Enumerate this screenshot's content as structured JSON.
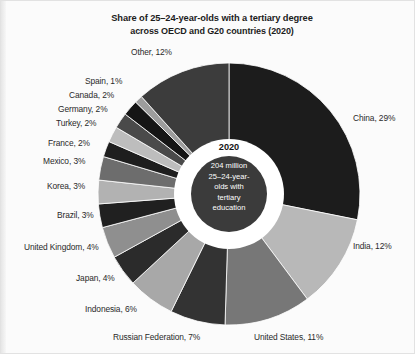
{
  "page": {
    "background_color": "#fbfbfb",
    "text_color": "#2a2a2a"
  },
  "title": {
    "line1": "Share of 25–24-year-olds with a tertiary degree",
    "line2": "across OECD and G20 countries (2020)"
  },
  "center": {
    "year": "2020",
    "annotation": "204 million 25–24-year-olds with tertiary education",
    "annotation_lines": [
      "204 million",
      "25–24-year-",
      "olds with",
      "tertiary",
      "education"
    ],
    "ring_color": "#ffffff",
    "inner_color": "#3b3b3b",
    "inner_text_color": "#ffffff"
  },
  "chart_data": {
    "type": "pie",
    "variant": "donut",
    "title": "Share of 25–24-year-olds with a tertiary degree across OECD and G20 countries (2020)",
    "legend": "none",
    "grid": false,
    "total_label": "204 million 25–24-year-olds with tertiary education",
    "units": "percent",
    "start_angle_deg": 0,
    "direction": "clockwise",
    "categories": [
      "China",
      "India",
      "United States",
      "Russian Federation",
      "Indonesia",
      "Japan",
      "United Kingdom",
      "Brazil",
      "Korea",
      "Mexico",
      "France",
      "Turkey",
      "Germany",
      "Canada",
      "Spain",
      "Other"
    ],
    "values": [
      29,
      12,
      11,
      7,
      6,
      4,
      4,
      3,
      3,
      3,
      2,
      2,
      2,
      2,
      1,
      12
    ],
    "slices": [
      {
        "label": "China, 29%",
        "name": "China",
        "value": 29,
        "color": "#1c1c1c",
        "label_x": 352,
        "label_y": 112,
        "align": "left"
      },
      {
        "label": "India, 12%",
        "name": "India",
        "value": 12,
        "color": "#b8b8b8",
        "label_x": 352,
        "label_y": 240,
        "align": "left"
      },
      {
        "label": "United States, 11%",
        "name": "United States",
        "value": 11,
        "color": "#777777",
        "label_x": 253,
        "label_y": 331,
        "align": "left"
      },
      {
        "label": "Russian Federation, 7%",
        "name": "Russian Federation",
        "value": 7,
        "color": "#333333",
        "label_x": 112,
        "label_y": 331,
        "align": "left"
      },
      {
        "label": "Indonesia, 6%",
        "name": "Indonesia",
        "value": 6,
        "color": "#a8a8a8",
        "label_x": 84,
        "label_y": 303,
        "align": "left"
      },
      {
        "label": "Japan, 4%",
        "name": "Japan",
        "value": 4,
        "color": "#2b2b2b",
        "label_x": 75,
        "label_y": 272,
        "align": "left"
      },
      {
        "label": "United Kingdom, 4%",
        "name": "United Kingdom",
        "value": 4,
        "color": "#8f8f8f",
        "label_x": 23,
        "label_y": 241,
        "align": "left"
      },
      {
        "label": "Brazil, 3%",
        "name": "Brazil",
        "value": 3,
        "color": "#202020",
        "label_x": 56,
        "label_y": 209,
        "align": "left"
      },
      {
        "label": "Korea, 3%",
        "name": "Korea",
        "value": 3,
        "color": "#b2b2b2",
        "label_x": 46,
        "label_y": 180,
        "align": "left"
      },
      {
        "label": "Mexico, 3%",
        "name": "Mexico",
        "value": 3,
        "color": "#6d6d6d",
        "label_x": 42,
        "label_y": 155,
        "align": "left"
      },
      {
        "label": "France, 2%",
        "name": "France",
        "value": 2,
        "color": "#1e1e1e",
        "label_x": 47,
        "label_y": 137,
        "align": "left"
      },
      {
        "label": "Turkey, 2%",
        "name": "Turkey",
        "value": 2,
        "color": "#bdbdbd",
        "label_x": 55,
        "label_y": 117,
        "align": "left"
      },
      {
        "label": "Germany, 2%",
        "name": "Germany",
        "value": 2,
        "color": "#4a4a4a",
        "label_x": 57,
        "label_y": 103,
        "align": "left"
      },
      {
        "label": "Canada, 2%",
        "name": "Canada",
        "value": 2,
        "color": "#151515",
        "label_x": 68,
        "label_y": 89,
        "align": "left"
      },
      {
        "label": "Spain, 1%",
        "name": "Spain",
        "value": 1,
        "color": "#9d9d9d",
        "label_x": 84,
        "label_y": 75,
        "align": "left"
      },
      {
        "label": "Other, 12%",
        "name": "Other",
        "value": 12,
        "color": "#3c3c3c",
        "label_x": 130,
        "label_y": 46,
        "align": "left"
      }
    ],
    "geometry": {
      "cx": 228,
      "cy": 193,
      "r_outer": 131,
      "r_ring": 55,
      "r_inner": 38
    }
  }
}
